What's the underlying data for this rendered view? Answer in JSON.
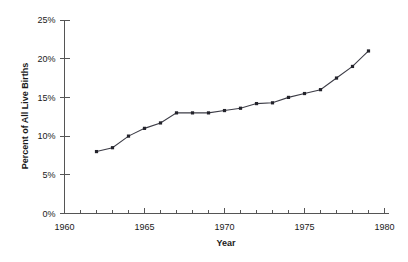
{
  "chart_data": {
    "type": "line",
    "title": "",
    "xlabel": "Year",
    "ylabel": "Percent of All Live Births",
    "xlim": [
      1960,
      1980
    ],
    "ylim": [
      0,
      25
    ],
    "grid": false,
    "legend": false,
    "x_tick_labels": [
      "1960",
      "1965",
      "1970",
      "1975",
      "1980"
    ],
    "x_tick_values": [
      1960,
      1965,
      1970,
      1975,
      1980
    ],
    "x_minor_tick_interval": 1,
    "y_tick_labels": [
      "0%",
      "5%",
      "10%",
      "15%",
      "20%",
      "25%"
    ],
    "y_tick_values": [
      0,
      5,
      10,
      15,
      20,
      25
    ],
    "marker": "square",
    "line_color": "#3c3c46",
    "marker_color": "#23232b",
    "axis_color": "#555555",
    "background_color": "#ffffff",
    "x": [
      1962,
      1963,
      1964,
      1965,
      1966,
      1967,
      1968,
      1969,
      1970,
      1971,
      1972,
      1973,
      1974,
      1975,
      1976,
      1977,
      1978,
      1979
    ],
    "values": [
      8.0,
      8.5,
      10.0,
      11.0,
      11.7,
      13.0,
      13.0,
      13.0,
      13.3,
      13.6,
      14.2,
      14.3,
      15.0,
      15.5,
      16.0,
      17.5,
      19.0,
      21.0
    ],
    "series": [
      {
        "name": "Percent of all live births",
        "values": [
          8.0,
          8.5,
          10.0,
          11.0,
          11.7,
          13.0,
          13.0,
          13.0,
          13.3,
          13.6,
          14.2,
          14.3,
          15.0,
          15.5,
          16.0,
          17.5,
          19.0,
          21.0
        ]
      }
    ]
  }
}
